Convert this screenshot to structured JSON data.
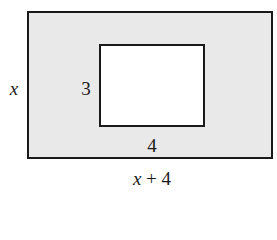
{
  "diagram": {
    "outer_rectangle": {
      "height_label": "x",
      "width_label": "x + 4",
      "fill": "#e9e9e9"
    },
    "inner_rectangle": {
      "height_label": "3",
      "width_label": "4",
      "fill": "#ffffff"
    },
    "width_label_parts": {
      "var": "x",
      "rest": " + 4"
    }
  }
}
